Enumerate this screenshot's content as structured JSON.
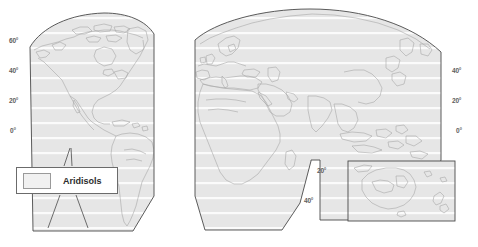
{
  "figure": {
    "kind": "world-soil-distribution-map",
    "projection": "interrupted-goode-homolosine-style",
    "background_color": "#ffffff"
  },
  "legend": {
    "label": "Aridisols",
    "swatch_fill": "#f1f1f1",
    "swatch_border": "#9a9a9a",
    "box_border": "#6b6b6b",
    "box_fill": "#ffffff"
  },
  "style": {
    "land_fill": "#e3e3e3",
    "panel_fill": "#e6e6e6",
    "panel_outline": "#4a4a4a",
    "graticule_color": "#fafafa",
    "coastline_color": "#a9a9a9",
    "label_color": "#5d5d5d"
  },
  "panels": [
    {
      "name": "western-hemisphere-panel",
      "label": "Americas"
    },
    {
      "name": "eastern-hemisphere-panel",
      "label": "Eurasia and Africa"
    },
    {
      "name": "oceania-inset-panel",
      "label": "Australia and Oceania"
    }
  ],
  "latitude_labels": {
    "west_panel": [
      {
        "text": "60°",
        "x": 9,
        "y": 41
      },
      {
        "text": "40°",
        "x": 9,
        "y": 70
      },
      {
        "text": "20°",
        "x": 9,
        "y": 100
      },
      {
        "text": "0°",
        "x": 10,
        "y": 131
      }
    ],
    "east_panel_right": [
      {
        "text": "40°",
        "x": 455,
        "y": 70
      },
      {
        "text": "20°",
        "x": 455,
        "y": 100
      },
      {
        "text": "0°",
        "x": 459,
        "y": 131
      }
    ],
    "east_panel_south": [
      {
        "text": "20°",
        "x": 319,
        "y": 171
      },
      {
        "text": "40°",
        "x": 306,
        "y": 201
      }
    ]
  },
  "graticule": {
    "parallels_deg": [
      60,
      40,
      20,
      0,
      -20,
      -40
    ],
    "line_spacing_px": 15
  }
}
